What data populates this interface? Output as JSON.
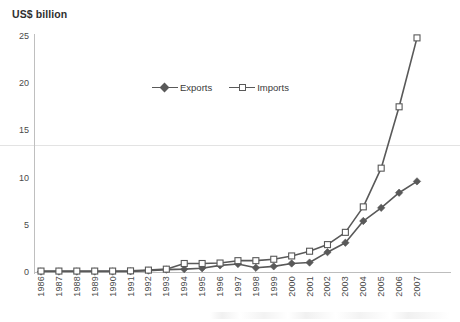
{
  "chart_data": {
    "type": "line",
    "title": "US$ billion",
    "xlabel": "",
    "ylabel": "US$ billion",
    "ylim": [
      0,
      25
    ],
    "yticks": [
      0,
      5,
      10,
      15,
      20,
      25
    ],
    "grid": false,
    "legend_position": "top-center",
    "categories": [
      "1986",
      "1987",
      "1988",
      "1989",
      "1990",
      "1991",
      "1992",
      "1993",
      "1994",
      "1995",
      "1996",
      "1997",
      "1998",
      "1999",
      "2000",
      "2001",
      "2002",
      "2003",
      "2004",
      "2005",
      "2006",
      "2007"
    ],
    "series": [
      {
        "name": "Exports",
        "marker": "filled-diamond",
        "color": "#595959",
        "values": [
          0.05,
          0.05,
          0.05,
          0.05,
          0.05,
          0.07,
          0.15,
          0.25,
          0.3,
          0.4,
          0.7,
          0.85,
          0.45,
          0.6,
          0.9,
          1.0,
          2.1,
          3.1,
          5.4,
          6.8,
          8.4,
          9.6
        ]
      },
      {
        "name": "Imports",
        "marker": "open-square",
        "color": "#595959",
        "values": [
          0.1,
          0.1,
          0.1,
          0.1,
          0.1,
          0.12,
          0.2,
          0.3,
          0.9,
          0.9,
          0.95,
          1.2,
          1.2,
          1.35,
          1.7,
          2.2,
          2.9,
          4.2,
          6.9,
          11.0,
          17.5,
          24.8
        ]
      }
    ]
  },
  "legend": {
    "entries": [
      {
        "label": "Exports"
      },
      {
        "label": "Imports"
      }
    ]
  }
}
